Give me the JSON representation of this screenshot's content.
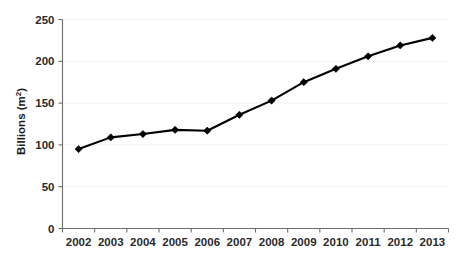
{
  "chart_data": {
    "type": "line",
    "title": "",
    "xlabel": "",
    "ylabel": "Billions (m2)",
    "ylabel_base": "Billions (m",
    "ylabel_sup": "2",
    "ylabel_tail": ")",
    "categories": [
      "2002",
      "2003",
      "2004",
      "2005",
      "2006",
      "2007",
      "2008",
      "2009",
      "2010",
      "2011",
      "2012",
      "2013"
    ],
    "values": [
      95,
      109,
      113,
      118,
      117,
      136,
      153,
      175,
      191,
      206,
      219,
      228
    ],
    "series": [
      {
        "name": "Billions (m2)",
        "values": [
          95,
          109,
          113,
          118,
          117,
          136,
          153,
          175,
          191,
          206,
          219,
          228
        ]
      }
    ],
    "ylim": [
      0,
      250
    ],
    "y_ticks": [
      "0",
      "50",
      "100",
      "150",
      "200",
      "250"
    ],
    "y_tick_values": [
      0,
      50,
      100,
      150,
      200,
      250
    ],
    "grid": true,
    "legend": "none",
    "marker": "diamond",
    "line_color": "#000000",
    "grid_color": "#f2f2f2",
    "axis_color": "#6e6e6e"
  }
}
